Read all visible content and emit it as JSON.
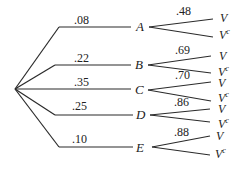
{
  "diagram": {
    "type": "probability-tree",
    "root": "start",
    "branches": [
      {
        "node": "A",
        "prob": ".08",
        "outcomes": [
          {
            "label": "V",
            "prob": ".48"
          },
          {
            "label": "V",
            "sup": "c"
          }
        ]
      },
      {
        "node": "B",
        "prob": ".22",
        "outcomes": [
          {
            "label": "V",
            "prob": ".69"
          },
          {
            "label": "V",
            "sup": "c"
          }
        ]
      },
      {
        "node": "C",
        "prob": ".35",
        "outcomes": [
          {
            "label": "V",
            "prob": ".70"
          },
          {
            "label": "V",
            "sup": "c"
          }
        ]
      },
      {
        "node": "D",
        "prob": ".25",
        "outcomes": [
          {
            "label": "V",
            "prob": ".86"
          },
          {
            "label": "V",
            "sup": "c"
          }
        ]
      },
      {
        "node": "E",
        "prob": ".10",
        "outcomes": [
          {
            "label": "V",
            "prob": ".88"
          },
          {
            "label": "V",
            "sup": "c"
          }
        ]
      }
    ]
  }
}
